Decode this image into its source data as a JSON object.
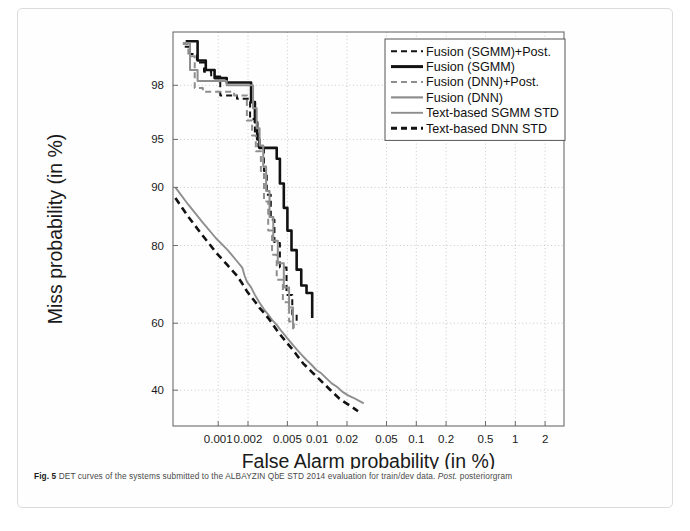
{
  "figure": {
    "caption_label": "Fig. 5",
    "caption_text": " DET curves of the systems submitted to the ALBAYZIN QbE STD 2014 evaluation for train/dev data. ",
    "caption_italic": "Post.",
    "caption_tail": " posteriorgram"
  },
  "chart_data": {
    "type": "line",
    "title": "",
    "xlabel": "False Alarm probability (in %)",
    "ylabel": "Miss probability (in %)",
    "xticks": [
      "0.001",
      "0.002",
      "0.005",
      "0.01",
      "0.02",
      "0.05",
      "0.1",
      "0.2",
      "0.5",
      "1",
      "2"
    ],
    "xtick_values": [
      0.001,
      0.002,
      0.005,
      0.01,
      0.02,
      0.05,
      0.1,
      0.2,
      0.5,
      1,
      2
    ],
    "yticks": [
      "98",
      "95",
      "90",
      "80",
      "60",
      "40"
    ],
    "ytick_values": [
      98,
      95,
      90,
      80,
      60,
      40
    ],
    "xlim": [
      0.00035,
      3.1
    ],
    "ylim": [
      30,
      99.3
    ],
    "grid": true,
    "scale": "normal-deviate (DET)",
    "legend_position": "top-right",
    "colors": {
      "black": "#121212",
      "gray": "#8e8e8e",
      "grid": "#bdbdbd",
      "frame": "#6b6b6b"
    },
    "series": [
      {
        "name": "Fusion (SGMM)+Post.",
        "color": "#121212",
        "style": "dashed",
        "width": 2.0,
        "points": [
          [
            0.00046,
            99.05
          ],
          [
            0.00052,
            99.05
          ],
          [
            0.00052,
            98.9
          ],
          [
            0.00061,
            98.9
          ],
          [
            0.00061,
            98.7
          ],
          [
            0.00072,
            98.7
          ],
          [
            0.00072,
            98.45
          ],
          [
            0.00085,
            98.45
          ],
          [
            0.00085,
            98.3
          ],
          [
            0.00105,
            98.3
          ],
          [
            0.00105,
            97.6
          ],
          [
            0.00155,
            97.6
          ],
          [
            0.00155,
            97.45
          ],
          [
            0.0021,
            97.45
          ],
          [
            0.0021,
            96.4
          ],
          [
            0.00235,
            96.4
          ],
          [
            0.00235,
            95.4
          ],
          [
            0.00255,
            95.4
          ],
          [
            0.00255,
            94.4
          ],
          [
            0.0029,
            94.4
          ],
          [
            0.0029,
            92.0
          ],
          [
            0.0031,
            92.0
          ],
          [
            0.0031,
            89.0
          ],
          [
            0.0034,
            89.0
          ],
          [
            0.0034,
            85.0
          ],
          [
            0.0037,
            85.0
          ],
          [
            0.0037,
            80.5
          ],
          [
            0.0042,
            80.5
          ],
          [
            0.0042,
            75.0
          ],
          [
            0.0049,
            75.0
          ],
          [
            0.0049,
            68.0
          ],
          [
            0.0056,
            68.0
          ],
          [
            0.0056,
            62.5
          ],
          [
            0.0062,
            62.5
          ],
          [
            0.0062,
            59.5
          ]
        ]
      },
      {
        "name": "Fusion (SGMM)",
        "color": "#121212",
        "style": "solid",
        "width": 2.6,
        "points": [
          [
            0.00047,
            99.15
          ],
          [
            0.00062,
            99.15
          ],
          [
            0.00062,
            98.75
          ],
          [
            0.00075,
            98.75
          ],
          [
            0.00075,
            98.5
          ],
          [
            0.00092,
            98.5
          ],
          [
            0.00092,
            98.25
          ],
          [
            0.00122,
            98.25
          ],
          [
            0.00122,
            98.1
          ],
          [
            0.00215,
            98.1
          ],
          [
            0.00215,
            97.3
          ],
          [
            0.00235,
            97.3
          ],
          [
            0.00235,
            96.2
          ],
          [
            0.00248,
            96.2
          ],
          [
            0.00248,
            95.0
          ],
          [
            0.0026,
            95.0
          ],
          [
            0.0026,
            94.3
          ],
          [
            0.0039,
            94.3
          ],
          [
            0.0039,
            93.3
          ],
          [
            0.0042,
            93.3
          ],
          [
            0.0042,
            90.5
          ],
          [
            0.0046,
            90.5
          ],
          [
            0.0046,
            87.0
          ],
          [
            0.005,
            87.0
          ],
          [
            0.005,
            83.0
          ],
          [
            0.0055,
            83.0
          ],
          [
            0.0055,
            79.0
          ],
          [
            0.0062,
            79.0
          ],
          [
            0.0062,
            74.5
          ],
          [
            0.0069,
            74.5
          ],
          [
            0.0069,
            70.5
          ],
          [
            0.0078,
            70.5
          ],
          [
            0.0078,
            68.5
          ],
          [
            0.0089,
            68.5
          ],
          [
            0.0089,
            61.5
          ]
        ]
      },
      {
        "name": "Fusion (DNN)+Post.",
        "color": "#8e8e8e",
        "style": "dashed",
        "width": 2.0,
        "points": [
          [
            0.00044,
            99.1
          ],
          [
            0.0005,
            99.1
          ],
          [
            0.0005,
            98.85
          ],
          [
            0.00058,
            98.85
          ],
          [
            0.00058,
            97.9
          ],
          [
            0.0007,
            97.9
          ],
          [
            0.0007,
            97.75
          ],
          [
            0.00145,
            97.75
          ],
          [
            0.00145,
            97.6
          ],
          [
            0.00195,
            97.6
          ],
          [
            0.00195,
            96.3
          ],
          [
            0.0022,
            96.3
          ],
          [
            0.0022,
            95.3
          ],
          [
            0.0024,
            95.3
          ],
          [
            0.0024,
            94.0
          ],
          [
            0.0027,
            94.0
          ],
          [
            0.0027,
            92.0
          ],
          [
            0.0029,
            92.0
          ],
          [
            0.0029,
            88.0
          ],
          [
            0.0032,
            88.0
          ],
          [
            0.0032,
            83.0
          ],
          [
            0.0035,
            83.0
          ],
          [
            0.0035,
            78.0
          ],
          [
            0.0039,
            78.0
          ],
          [
            0.0039,
            72.0
          ],
          [
            0.0045,
            72.0
          ],
          [
            0.0045,
            66.0
          ],
          [
            0.0052,
            66.0
          ],
          [
            0.0052,
            60.5
          ],
          [
            0.0058,
            60.5
          ],
          [
            0.0058,
            58.5
          ]
        ]
      },
      {
        "name": "Fusion (DNN)",
        "color": "#8e8e8e",
        "style": "solid",
        "width": 2.0,
        "points": [
          [
            0.00044,
            99.12
          ],
          [
            0.00052,
            99.12
          ],
          [
            0.00052,
            98.5
          ],
          [
            0.00062,
            98.5
          ],
          [
            0.00062,
            98.15
          ],
          [
            0.00122,
            98.15
          ],
          [
            0.00122,
            98.0
          ],
          [
            0.00225,
            98.0
          ],
          [
            0.00225,
            97.0
          ],
          [
            0.00245,
            97.0
          ],
          [
            0.00245,
            95.8
          ],
          [
            0.00262,
            95.8
          ],
          [
            0.00262,
            94.5
          ],
          [
            0.00285,
            94.5
          ],
          [
            0.00285,
            92.5
          ],
          [
            0.00305,
            92.5
          ],
          [
            0.00305,
            89.5
          ],
          [
            0.0033,
            89.5
          ],
          [
            0.0033,
            85.5
          ],
          [
            0.0036,
            85.5
          ],
          [
            0.0036,
            81.0
          ],
          [
            0.004,
            81.0
          ],
          [
            0.004,
            76.0
          ],
          [
            0.0046,
            76.0
          ],
          [
            0.0046,
            70.0
          ],
          [
            0.0052,
            70.0
          ],
          [
            0.0052,
            64.5
          ],
          [
            0.0057,
            64.5
          ],
          [
            0.0057,
            58.2
          ]
        ]
      },
      {
        "name": "Text-based SGMM STD",
        "color": "#8e8e8e",
        "style": "solid",
        "width": 1.9,
        "points": [
          [
            0.00037,
            90.0
          ],
          [
            0.0005,
            87.5
          ],
          [
            0.0007,
            84.5
          ],
          [
            0.00095,
            81.5
          ],
          [
            0.00125,
            79.0
          ],
          [
            0.00155,
            76.5
          ],
          [
            0.00175,
            75.0
          ],
          [
            0.00185,
            73.0
          ],
          [
            0.00195,
            71.5
          ],
          [
            0.00215,
            70.0
          ],
          [
            0.00235,
            68.0
          ],
          [
            0.0026,
            66.0
          ],
          [
            0.0029,
            64.0
          ],
          [
            0.0032,
            62.5
          ],
          [
            0.0035,
            61.0
          ],
          [
            0.0039,
            59.5
          ],
          [
            0.0044,
            57.5
          ],
          [
            0.005,
            55.5
          ],
          [
            0.0057,
            53.5
          ],
          [
            0.0063,
            52.0
          ],
          [
            0.007,
            50.5
          ],
          [
            0.0078,
            49.0
          ],
          [
            0.0088,
            47.5
          ],
          [
            0.0098,
            46.0
          ],
          [
            0.011,
            45.0
          ],
          [
            0.0124,
            43.5
          ],
          [
            0.014,
            42.0
          ],
          [
            0.0158,
            41.0
          ],
          [
            0.018,
            39.5
          ],
          [
            0.0205,
            38.5
          ],
          [
            0.0232,
            37.8
          ],
          [
            0.0262,
            37.0
          ],
          [
            0.0295,
            36.2
          ]
        ]
      },
      {
        "name": "Text-based DNN STD",
        "color": "#121212",
        "style": "dashed",
        "width": 2.6,
        "points": [
          [
            0.00037,
            88.5
          ],
          [
            0.0005,
            85.5
          ],
          [
            0.0007,
            82.0
          ],
          [
            0.00095,
            78.5
          ],
          [
            0.00125,
            75.5
          ],
          [
            0.00155,
            73.0
          ],
          [
            0.00175,
            71.0
          ],
          [
            0.00195,
            69.0
          ],
          [
            0.00215,
            67.5
          ],
          [
            0.00238,
            66.0
          ],
          [
            0.0026,
            64.5
          ],
          [
            0.0029,
            63.0
          ],
          [
            0.0032,
            61.5
          ],
          [
            0.0035,
            60.0
          ],
          [
            0.0039,
            58.0
          ],
          [
            0.0044,
            56.0
          ],
          [
            0.005,
            54.0
          ],
          [
            0.0057,
            52.0
          ],
          [
            0.0064,
            50.0
          ],
          [
            0.0072,
            48.0
          ],
          [
            0.0081,
            46.5
          ],
          [
            0.0091,
            45.0
          ],
          [
            0.0103,
            43.5
          ],
          [
            0.0116,
            42.0
          ],
          [
            0.0131,
            40.5
          ],
          [
            0.0148,
            39.0
          ],
          [
            0.0168,
            37.5
          ],
          [
            0.019,
            36.5
          ],
          [
            0.0215,
            35.5
          ],
          [
            0.0243,
            34.5
          ],
          [
            0.0258,
            34.0
          ]
        ]
      }
    ],
    "legend": [
      {
        "label": "Fusion (SGMM)+Post.",
        "color": "#121212",
        "style": "dashed",
        "width": 2.0
      },
      {
        "label": "Fusion (SGMM)",
        "color": "#121212",
        "style": "solid",
        "width": 3.0
      },
      {
        "label": "Fusion (DNN)+Post.",
        "color": "#8e8e8e",
        "style": "dashed",
        "width": 2.2
      },
      {
        "label": "Fusion (DNN)",
        "color": "#8e8e8e",
        "style": "solid",
        "width": 2.2
      },
      {
        "label": "Text-based SGMM STD",
        "color": "#8e8e8e",
        "style": "solid",
        "width": 1.9
      },
      {
        "label": "Text-based DNN STD",
        "color": "#121212",
        "style": "dashed",
        "width": 3.0
      }
    ]
  }
}
